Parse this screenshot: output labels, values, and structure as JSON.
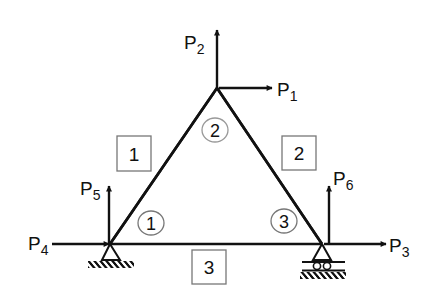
{
  "diagram": {
    "type": "truss",
    "colors": {
      "stroke": "#111111",
      "box_stroke": "#777777",
      "background": "#ffffff"
    },
    "nodes": [
      {
        "id": "1",
        "label": "1",
        "x": 110,
        "y": 244,
        "support": "pin"
      },
      {
        "id": "2",
        "label": "2",
        "x": 217,
        "y": 88,
        "support": "none"
      },
      {
        "id": "3",
        "label": "3",
        "x": 322,
        "y": 244,
        "support": "roller"
      }
    ],
    "members": [
      {
        "id": "1",
        "label": "1",
        "from": "1",
        "to": "2"
      },
      {
        "id": "2",
        "label": "2",
        "from": "2",
        "to": "3"
      },
      {
        "id": "3",
        "label": "3",
        "from": "1",
        "to": "3"
      }
    ],
    "loads": [
      {
        "name": "P",
        "sub": "1",
        "node": "2",
        "direction": "right"
      },
      {
        "name": "P",
        "sub": "2",
        "node": "2",
        "direction": "up"
      },
      {
        "name": "P",
        "sub": "3",
        "node": "3",
        "direction": "right"
      },
      {
        "name": "P",
        "sub": "4",
        "node": "1",
        "direction": "right"
      },
      {
        "name": "P",
        "sub": "5",
        "node": "1",
        "direction": "up"
      },
      {
        "name": "P",
        "sub": "6",
        "node": "3",
        "direction": "up"
      }
    ]
  }
}
